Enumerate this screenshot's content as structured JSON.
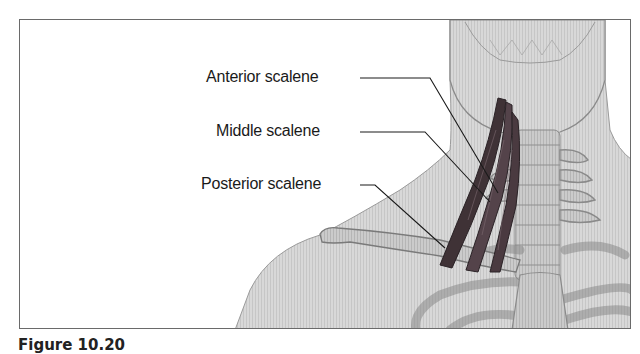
{
  "figure": {
    "labels": [
      {
        "id": "anterior",
        "text": "Anterior scalene"
      },
      {
        "id": "middle",
        "text": "Middle scalene"
      },
      {
        "id": "posterior",
        "text": "Posterior scalene"
      }
    ],
    "caption": {
      "prefix": "Figure 10.20",
      "text": "Scalene muscles (partially cut off)"
    },
    "colors": {
      "frame": "#6a6a6a",
      "skin": "#d4d4d4",
      "bone": "#c4c4c4",
      "muscle": "#4a3a3e",
      "leader_line": "#1a1a1a"
    }
  }
}
